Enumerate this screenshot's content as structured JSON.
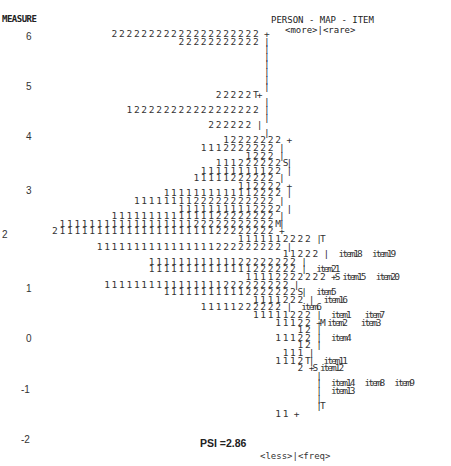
{
  "header": {
    "measure_label": "MEASURE",
    "map_title": "PERSON - MAP - ITEM",
    "top_labels": "<more>|<rare>"
  },
  "footer": {
    "bottom_labels": "<less>|<freq>",
    "psi": "PSI =2.86"
  },
  "y_ticks": [
    {
      "label": "6",
      "top": 31,
      "left": 26
    },
    {
      "label": "5",
      "top": 81,
      "left": 26
    },
    {
      "label": "4",
      "top": 131,
      "left": 26
    },
    {
      "label": "3",
      "top": 185,
      "left": 26
    },
    {
      "label": "2",
      "top": 229,
      "left": 2
    },
    {
      "label": "1",
      "top": 283,
      "left": 26
    },
    {
      "label": "0",
      "top": 333,
      "left": 26
    },
    {
      "label": "-1",
      "top": 384,
      "left": 21
    },
    {
      "label": "-2",
      "top": 434,
      "left": 21
    }
  ],
  "map_lines": [
    "                              2 2 2 2 2 2 2 2 2 2 2 2 2 2 2 2 2 2 2 2  +",
    "                                                2 2 2 2 2 2 2 2 2 2 2  |",
    "                                                                       |",
    "                                                                       |",
    "                                                                       |",
    "                                                                       |",
    "                                                                       |",
    "                                                                       |",
    "                                                          2 2 2 2 2 T+",
    "                                                                       |",
    "                                  1 2 2 2 2 2 2 2 2 2 2 2 2 2 2 2 2 2  |",
    "                                                                       |",
    "                                                        2 2 2 2 2 2  |",
    "                                                                       |",
    "                                                            1 2 2 2 2 2 2 2  +",
    "                                                      1 1 1 2 2 2 2 2 2 2  |",
    "                                                                  1 2 2 2  |",
    "                                                          1 1 1 2 2 2 2 2 2 S|",
    "                                                      1 1 1 1 1 1 1 1 1 2 2  |",
    "                                                    1 1 1 1 1 2 2 2 2 2 2  |",
    "                                                                1 1 2 2 2 2  +",
    "                                            1 1 1 1 1 1 1 1 1 1 1 1 2 2 2 2  |",
    "                                    1 1 1 1 1 1 1 1 2 2 2 2 2 2 2 2 2 2 2  |",
    "                                                1 1 1 1 1 1 1 1 1 1 2 2 2 2  |",
    "                              1 1 1 1 1 1 1 1 1 1 1 1 1 1 2 2 2 2 2 2 2 2  |",
    "                1 1 1 1 1 1 1 1 1 1 1 1 1 1 1 1 1 1 2 2 2 2 2 2 2 2 2 2 2 M|",
    "              2 1 1 1 1 1 1 1 1 1 1 1 1 1 1 1 1 1 1 1 1 1 2 2 2 2 2 2 2 2  +",
    "                                                                1 1 1 1 1 1 2 2 2 2  |T",
    "                          1 1 1 1 1 1 1 1 1 1 1 1 1 1 1 1 2 2 2 2 2 2 2 2 2  |",
    "                                                                            1 1 2 2 2  |   item18   item19",
    "                                        1 1 1 1 1 1 1 1 1 1 1 1 2 2 2 2 2 2 2 2  |",
    "                                        1 1 1 1 1 1 1 1 1 1 1 1 1 1 2 2 2 2 2 2  |   item21",
    "                                                                  1 1 1 1 2 2 2 2 2 2 2  +S item15   item20",
    "                            1 1 1 1 1 1 1 1 1 1 1 1 1 1 1 1 2 2 2 2 2 2 2 2 2  |",
    "                                            1 1 1 1 1 1 1 1 1 1 1 2 2 2 2 2 2 2 S|   item5",
    "                                                                    1 1 1 1 2 2 2  |   item16",
    "                                                      1 1 1 1 1 2 2 2 2 2 2  |   item6",
    "                                                                    1 1 1 1 1 2 2 2  |   item1    item7",
    "                                                                          1 1 1 2 2  +M item2    item3",
    "                                                                                1 2  |",
    "                                                                          1 1 1 2 2  |   item4",
    "                                                                                1 2  |",
    "                                                                            1 1 1  |",
    "                                                                          1 1 1 2 T|   item11",
    "                                                                                2  +S item12",
    "                                                                                     |",
    "                                                                                     |   item14   item8   item9",
    "                                                                                     |   item13",
    "                                                                                     |",
    "                                                                                     |T",
    "                                                                          1 1  +"
  ],
  "chart_data": {
    "type": "table",
    "title": "PERSON - MAP - ITEM",
    "ylabel": "MEASURE",
    "ylim": [
      -2,
      6
    ],
    "y_ticks": [
      6,
      5,
      4,
      3,
      2,
      1,
      0,
      -1,
      -2
    ],
    "axis_markers": {
      "top": "<more>|<rare>",
      "bottom": "<less>|<freq>",
      "person_side": [
        "M (mean ~2.1)",
        "S",
        "T"
      ],
      "item_side": [
        "M (mean ~0)",
        "S",
        "T"
      ]
    },
    "items": [
      {
        "label": "item18",
        "measure": 1.6
      },
      {
        "label": "item19",
        "measure": 1.6
      },
      {
        "label": "item21",
        "measure": 1.2
      },
      {
        "label": "item15",
        "measure": 1.0
      },
      {
        "label": "item20",
        "measure": 1.0
      },
      {
        "label": "item5",
        "measure": 0.7
      },
      {
        "label": "item16",
        "measure": 0.55
      },
      {
        "label": "item6",
        "measure": 0.4
      },
      {
        "label": "item1",
        "measure": 0.2
      },
      {
        "label": "item7",
        "measure": 0.2
      },
      {
        "label": "item2",
        "measure": 0.05
      },
      {
        "label": "item3",
        "measure": 0.05
      },
      {
        "label": "item4",
        "measure": -0.3
      },
      {
        "label": "item11",
        "measure": -0.9
      },
      {
        "label": "item12",
        "measure": -1.05
      },
      {
        "label": "item14",
        "measure": -1.4
      },
      {
        "label": "item8",
        "measure": -1.4
      },
      {
        "label": "item9",
        "measure": -1.4
      },
      {
        "label": "item13",
        "measure": -1.55
      }
    ],
    "annotations": [
      "PSI =2.86"
    ]
  }
}
